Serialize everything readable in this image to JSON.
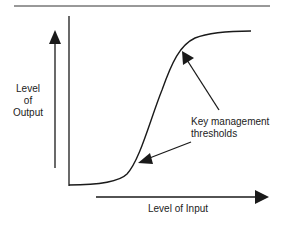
{
  "diagram": {
    "type": "s-curve",
    "y_axis_label_lines": [
      "Level",
      "of",
      "Output"
    ],
    "x_axis_label": "Level of Input",
    "annotation_lines": [
      "Key management",
      "thresholds"
    ],
    "annotation_points": [
      "lower-bend",
      "upper-bend"
    ],
    "colors": {
      "line": "#1a1a1a",
      "text": "#222222",
      "background": "#ffffff"
    }
  }
}
